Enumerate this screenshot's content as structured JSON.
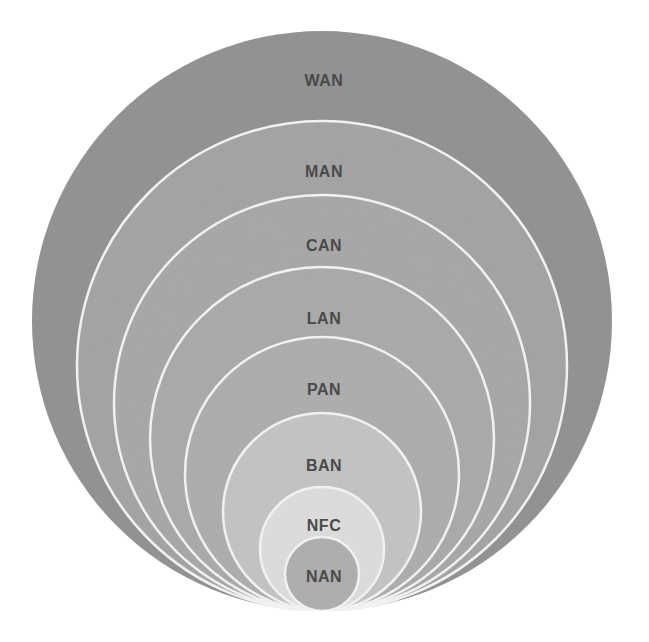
{
  "diagram": {
    "type": "nested-circles",
    "anchor": {
      "x": 322,
      "y": 611
    },
    "rings": [
      {
        "label": "WAN",
        "radius": 290,
        "color": "#8f8f8f",
        "label_y": 80
      },
      {
        "label": "MAN",
        "radius": 245,
        "color": "#a2a2a2",
        "label_y": 171
      },
      {
        "label": "CAN",
        "radius": 208,
        "color": "#a6a6a6",
        "label_y": 245
      },
      {
        "label": "LAN",
        "radius": 172,
        "color": "#a8a8a8",
        "label_y": 318
      },
      {
        "label": "PAN",
        "radius": 137,
        "color": "#acacac",
        "label_y": 389
      },
      {
        "label": "BAN",
        "radius": 99,
        "color": "#c3c3c3",
        "label_y": 465
      },
      {
        "label": "NFC",
        "radius": 62,
        "color": "#dddddd",
        "label_y": 525
      },
      {
        "label": "NAN",
        "radius": 37,
        "color": "#adadad",
        "label_y": 576
      }
    ]
  }
}
